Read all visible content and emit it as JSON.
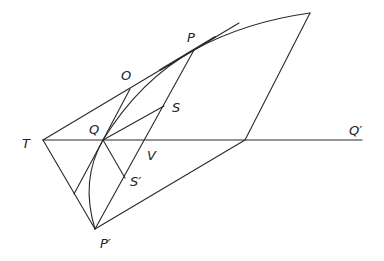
{
  "figure": {
    "labels": {
      "P": "P",
      "O": "O",
      "S": "S",
      "Q": "Q",
      "T": "T",
      "V": "V",
      "S_prime": "S′",
      "P_prime": "P′",
      "Q_prime": "Q′"
    },
    "points": {
      "T": [
        43,
        140
      ],
      "P": [
        194,
        50
      ],
      "P_prime": [
        95,
        229
      ],
      "Q": [
        103,
        140
      ],
      "O": [
        130,
        89
      ],
      "S": [
        164,
        106
      ],
      "S_prime": [
        125,
        178
      ],
      "V": [
        149,
        140
      ],
      "top_right": [
        310,
        13
      ],
      "base_right": [
        245,
        140
      ],
      "Q_prime_end": [
        362,
        140
      ],
      "tangent_end": [
        239,
        23
      ],
      "TP_prime_mid": [
        74,
        194
      ]
    },
    "line_color": "#2a2a2a"
  }
}
